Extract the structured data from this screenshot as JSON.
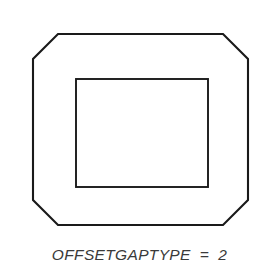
{
  "figure": {
    "title": "OFFSETGAPTYPE = 2",
    "background_color": "#ffffff",
    "stroke_color": "#1a1a1a",
    "caption": {
      "parameter_name": "OFFSETGAPTYPE",
      "equals_sign": "=",
      "value": "2",
      "full_text": "OFFSETGAPTYPE  =  2",
      "color": "#3a3a3a",
      "style": "italic"
    },
    "shapes": {
      "outer": {
        "name": "chamfered-octagon",
        "type": "polygon",
        "description": "rounded/chamfered rectangle outline (octagon)",
        "bounds": {
          "left": 33,
          "top": 34,
          "right": 248,
          "bottom": 225
        },
        "chamfer": 25,
        "points": "58,34 223,34 248,59 248,200 223,225 58,225 33,200 33,59",
        "stroke_width": 2.1,
        "fill": "#ffffff"
      },
      "inner": {
        "name": "inner-rectangle",
        "type": "rect",
        "description": "inner rectangular opening",
        "bounds": {
          "left": 76,
          "top": 79,
          "right": 208,
          "bottom": 187
        },
        "width": 132,
        "height": 108,
        "stroke_width": 1.9,
        "fill": "#ffffff"
      }
    }
  }
}
